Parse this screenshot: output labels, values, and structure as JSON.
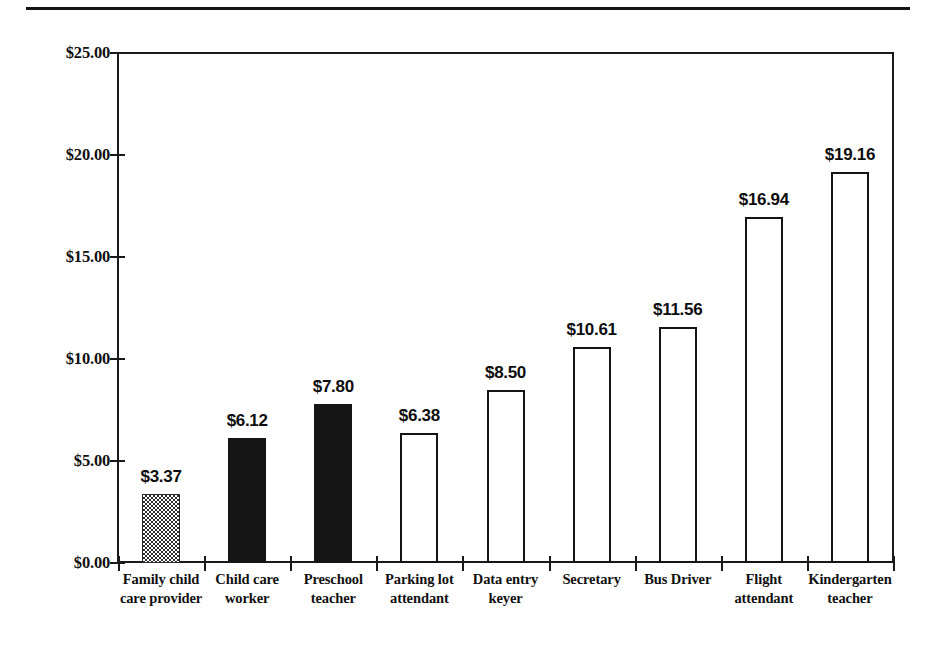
{
  "figure": {
    "has_top_rule": true,
    "background_color": "#ffffff",
    "ink_color": "#141414"
  },
  "chart_data": {
    "type": "bar",
    "title": "",
    "subtitle": "",
    "xlabel": "",
    "ylabel": "",
    "ylim": [
      0,
      25
    ],
    "ytick_step": 5,
    "grid": false,
    "legend": null,
    "orientation": "vertical",
    "value_prefix": "$",
    "categories": [
      "Family child care provider",
      "Child care worker",
      "Preschool teacher",
      "Parking lot attendant",
      "Data entry keyer",
      "Secretary",
      "Bus Driver",
      "Flight attendant",
      "Kindergarten teacher"
    ],
    "category_lines": [
      [
        "Family child",
        "care provider"
      ],
      [
        "Child care",
        "worker"
      ],
      [
        "Preschool",
        "teacher"
      ],
      [
        "Parking lot",
        "attendant"
      ],
      [
        "Data entry",
        "keyer"
      ],
      [
        "Secretary"
      ],
      [
        "Bus Driver"
      ],
      [
        "Flight",
        "attendant"
      ],
      [
        "Kindergarten",
        "teacher"
      ]
    ],
    "values": [
      3.37,
      6.12,
      7.8,
      6.38,
      8.5,
      10.61,
      11.56,
      16.94,
      19.16
    ],
    "value_labels": [
      "$3.37",
      "$6.12",
      "$7.80",
      "$6.38",
      "$8.50",
      "$10.61",
      "$11.56",
      "$16.94",
      "$19.16"
    ],
    "bar_fills": [
      "checker",
      "solid",
      "solid",
      "open",
      "open",
      "open",
      "open",
      "open",
      "open"
    ],
    "ytick_labels": [
      "$25.00",
      "$20.00",
      "$15.00",
      "$10.00",
      "$5.00",
      "$0.00"
    ],
    "ytick_values": [
      25,
      20,
      15,
      10,
      5,
      0
    ]
  }
}
